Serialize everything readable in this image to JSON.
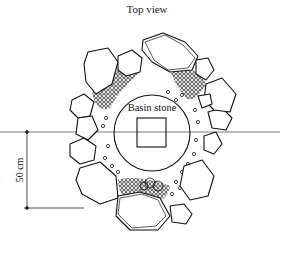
{
  "diagram": {
    "title": "Top view",
    "center_label": "Basin stone",
    "dimension_label": "50 cm",
    "colors": {
      "ink": "#111111",
      "background": "#ffffff",
      "guide_line": "#555555"
    }
  }
}
